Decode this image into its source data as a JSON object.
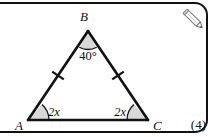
{
  "question": {
    "marks_label": "(4)",
    "pencil_icon": "pencil-icon"
  },
  "figure": {
    "type": "triangle-diagram",
    "vertices": [
      {
        "name": "B",
        "label": "B",
        "x": 88,
        "y": 31
      },
      {
        "name": "A",
        "label": "A",
        "x": 28,
        "y": 120
      },
      {
        "name": "C",
        "label": "C",
        "x": 148,
        "y": 120
      }
    ],
    "angles": [
      {
        "at": "B",
        "label": "40°",
        "value_text": "40",
        "degree_symbol": "°"
      },
      {
        "at": "A",
        "label": "2x"
      },
      {
        "at": "C",
        "label": "2x"
      }
    ],
    "side_marks": [
      {
        "side": "AB",
        "ticks": 1
      },
      {
        "side": "BC",
        "ticks": 1
      }
    ],
    "colors": {
      "stroke": "#111111",
      "angle_fill": "#d8d8d8",
      "background": "#ffffff"
    }
  }
}
